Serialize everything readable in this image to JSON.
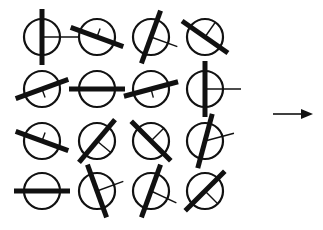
{
  "diagram": {
    "stroke_color": "#111111",
    "background": "#ffffff",
    "circle_radius": 18,
    "bar_half_length": 28,
    "bar_width": 5,
    "columns_x": [
      42,
      97,
      151,
      205
    ],
    "rows_y": [
      37,
      89,
      141,
      191
    ],
    "glyphs": [
      {
        "row": 0,
        "col": 0,
        "bar_angle": 90,
        "line_angle": 0,
        "line_length": 36
      },
      {
        "row": 0,
        "col": 1,
        "bar_angle": 20,
        "line_angle": -70,
        "line_length": 9
      },
      {
        "row": 0,
        "col": 2,
        "bar_angle": -70,
        "line_angle": 20,
        "line_length": 28
      },
      {
        "row": 0,
        "col": 3,
        "bar_angle": 35,
        "line_angle": -55,
        "line_length": 18
      },
      {
        "row": 1,
        "col": 0,
        "bar_angle": -20,
        "line_angle": 70,
        "line_length": 9
      },
      {
        "row": 1,
        "col": 1,
        "bar_angle": 0,
        "line_angle": null,
        "line_length": 0
      },
      {
        "row": 1,
        "col": 2,
        "bar_angle": -15,
        "line_angle": 75,
        "line_length": 9
      },
      {
        "row": 1,
        "col": 3,
        "bar_angle": 90,
        "line_angle": 0,
        "line_length": 36
      },
      {
        "row": 2,
        "col": 0,
        "bar_angle": 20,
        "line_angle": -70,
        "line_length": 9
      },
      {
        "row": 2,
        "col": 1,
        "bar_angle": -50,
        "line_angle": 40,
        "line_length": 18
      },
      {
        "row": 2,
        "col": 2,
        "bar_angle": 45,
        "line_angle": -45,
        "line_length": 18
      },
      {
        "row": 2,
        "col": 3,
        "bar_angle": -75,
        "line_angle": -15,
        "line_length": 30
      },
      {
        "row": 3,
        "col": 0,
        "bar_angle": 0,
        "line_angle": null,
        "line_length": 0
      },
      {
        "row": 3,
        "col": 1,
        "bar_angle": 70,
        "line_angle": -20,
        "line_length": 28
      },
      {
        "row": 3,
        "col": 2,
        "bar_angle": -70,
        "line_angle": 25,
        "line_length": 28
      },
      {
        "row": 3,
        "col": 3,
        "bar_angle": -45,
        "line_angle": 45,
        "line_length": 18
      }
    ],
    "arrow": {
      "x1": 273,
      "y1": 114,
      "x2": 313,
      "y2": 114,
      "direction": "right"
    }
  }
}
